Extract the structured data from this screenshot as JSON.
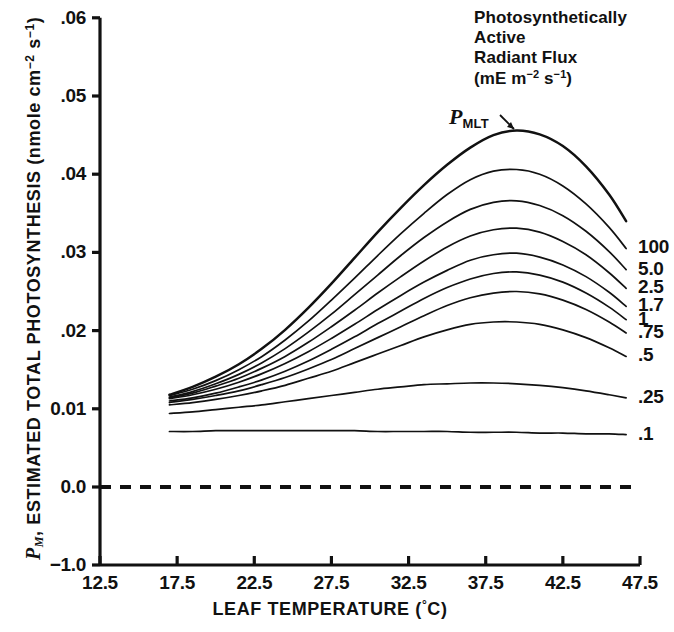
{
  "chart_data": {
    "type": "line",
    "title": "",
    "xlabel": "LEAF TEMPERATURE (°C)",
    "ylabel": "P_M, ESTIMATED TOTAL PHOTOSYNTHESIS (nmole cm^-2 s^-1)",
    "ylabel_prefix": "P",
    "ylabel_prefix_sub": "M",
    "ylabel_main": ", ESTIMATED TOTAL PHOTOSYNTHESIS (nmole cm",
    "ylabel_sup1": "−2",
    "ylabel_mid": " s",
    "ylabel_sup2": "−1",
    "ylabel_end": ")",
    "xlim": [
      12.5,
      47.5
    ],
    "ylim": [
      0.0,
      0.06
    ],
    "y_broken_bottom": "-1.0",
    "grid": false,
    "legend_position": "right-of-curves",
    "xticks": [
      "12.5",
      "17.5",
      "22.5",
      "27.5",
      "32.5",
      "37.5",
      "42.5",
      "47.5"
    ],
    "xtick_values": [
      12.5,
      17.5,
      22.5,
      27.5,
      32.5,
      37.5,
      42.5,
      47.5
    ],
    "yticks": [
      "-1.0",
      "0.0",
      "0.01",
      ".02",
      ".03",
      ".04",
      ".05",
      ".06"
    ],
    "ytick_values": [
      -1.0,
      0.0,
      0.01,
      0.02,
      0.03,
      0.04,
      0.05,
      0.06
    ],
    "zero_reference_line": {
      "value": 0.0,
      "style": "dashed",
      "label": ""
    },
    "annotation": {
      "text": "P",
      "subscript": "MLT",
      "full": "PMLT",
      "description": "arrow pointing to topmost curve"
    },
    "legend_heading": [
      "Photosynthetically",
      "Active",
      "Radiant Flux"
    ],
    "legend_units_prefix": "(mE m",
    "legend_units_sup1": "−2",
    "legend_units_mid": " s",
    "legend_units_sup2": "−1",
    "legend_units_end": ")",
    "x": [
      17.0,
      18.5,
      20.0,
      21.5,
      23.0,
      24.5,
      26.0,
      27.5,
      29.0,
      30.5,
      32.0,
      33.5,
      35.0,
      36.5,
      38.0,
      39.5,
      41.0,
      42.5,
      44.0,
      45.5,
      46.6
    ],
    "series": [
      {
        "name": "PMLT",
        "label": "",
        "peak_x": 38.5,
        "peak_y": 0.0456,
        "values": [
          0.0118,
          0.0128,
          0.0141,
          0.0157,
          0.0177,
          0.0201,
          0.0229,
          0.026,
          0.0293,
          0.0326,
          0.0357,
          0.0386,
          0.0412,
          0.0434,
          0.045,
          0.0456,
          0.0451,
          0.0436,
          0.041,
          0.0374,
          0.034
        ]
      },
      {
        "name": "100",
        "label": "100",
        "peak_x": 38.0,
        "peak_y": 0.0406,
        "values": [
          0.0117,
          0.0125,
          0.0136,
          0.015,
          0.0167,
          0.0188,
          0.0212,
          0.0239,
          0.0267,
          0.0296,
          0.0324,
          0.035,
          0.0374,
          0.0393,
          0.0404,
          0.0406,
          0.04,
          0.0385,
          0.0362,
          0.0332,
          0.0305
        ]
      },
      {
        "name": "5.0",
        "label": "5.0",
        "peak_x": 38.0,
        "peak_y": 0.0366,
        "values": [
          0.0115,
          0.0122,
          0.0132,
          0.0144,
          0.0159,
          0.0177,
          0.0198,
          0.0221,
          0.0246,
          0.0271,
          0.0296,
          0.0319,
          0.0339,
          0.0355,
          0.0364,
          0.0366,
          0.036,
          0.0347,
          0.0327,
          0.0301,
          0.0278
        ]
      },
      {
        "name": "2.5",
        "label": "2.5",
        "peak_x": 38.0,
        "peak_y": 0.0331,
        "values": [
          0.0114,
          0.012,
          0.0129,
          0.0139,
          0.0152,
          0.0167,
          0.0185,
          0.0205,
          0.0226,
          0.0248,
          0.0269,
          0.0289,
          0.0307,
          0.0321,
          0.0329,
          0.0331,
          0.0326,
          0.0314,
          0.0297,
          0.0274,
          0.0254
        ]
      },
      {
        "name": "1.7",
        "label": "1.7",
        "peak_x": 38.0,
        "peak_y": 0.0299,
        "values": [
          0.0113,
          0.0118,
          0.0125,
          0.0134,
          0.0145,
          0.0158,
          0.0173,
          0.019,
          0.0208,
          0.0227,
          0.0245,
          0.0262,
          0.0277,
          0.029,
          0.0297,
          0.0299,
          0.0294,
          0.0284,
          0.0269,
          0.0249,
          0.0231
        ]
      },
      {
        "name": "1",
        "label": "1",
        "peak_x": 38.0,
        "peak_y": 0.0275,
        "values": [
          0.011,
          0.0114,
          0.012,
          0.0128,
          0.0137,
          0.0148,
          0.0161,
          0.0176,
          0.0192,
          0.0209,
          0.0225,
          0.0241,
          0.0255,
          0.0266,
          0.0273,
          0.0275,
          0.0271,
          0.0262,
          0.0248,
          0.023,
          0.0214
        ]
      },
      {
        "name": ".75",
        "label": ".75",
        "peak_x": 38.0,
        "peak_y": 0.025,
        "values": [
          0.0108,
          0.0112,
          0.0117,
          0.0123,
          0.0131,
          0.014,
          0.0151,
          0.0163,
          0.0177,
          0.0191,
          0.0205,
          0.0219,
          0.0232,
          0.0242,
          0.0248,
          0.025,
          0.0247,
          0.0239,
          0.0227,
          0.0211,
          0.0197
        ]
      },
      {
        "name": ".5",
        "label": ".5",
        "peak_x": 37.5,
        "peak_y": 0.0211,
        "values": [
          0.0105,
          0.0108,
          0.0112,
          0.0117,
          0.0123,
          0.013,
          0.0139,
          0.0148,
          0.0159,
          0.017,
          0.0181,
          0.0192,
          0.0201,
          0.0208,
          0.0211,
          0.0211,
          0.0208,
          0.0201,
          0.0191,
          0.0178,
          0.0167
        ]
      },
      {
        "name": ".25",
        "label": ".25",
        "peak_x": 37.0,
        "peak_y": 0.0133,
        "values": [
          0.0094,
          0.0096,
          0.0099,
          0.0102,
          0.0105,
          0.0109,
          0.0113,
          0.0117,
          0.0121,
          0.0125,
          0.0128,
          0.0131,
          0.0132,
          0.0133,
          0.0133,
          0.0132,
          0.013,
          0.0127,
          0.0123,
          0.0118,
          0.0114
        ]
      },
      {
        "name": ".1",
        "label": ".1",
        "peak_x": 30.0,
        "peak_y": 0.0072,
        "values": [
          0.0071,
          0.0071,
          0.0072,
          0.0072,
          0.0072,
          0.0072,
          0.0072,
          0.0072,
          0.0072,
          0.0071,
          0.0071,
          0.0071,
          0.0071,
          0.007,
          0.007,
          0.007,
          0.0069,
          0.0069,
          0.0068,
          0.0068,
          0.0067
        ]
      }
    ]
  },
  "colors": {
    "ink": "#111111",
    "background": "#ffffff"
  }
}
